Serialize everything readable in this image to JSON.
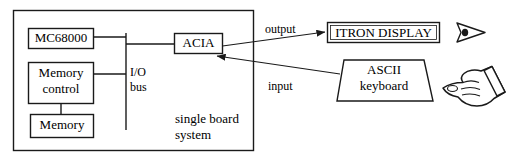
{
  "diagram": {
    "stroke_color": "#1a1a1a",
    "fill_color": "#ffffff",
    "text_color": "#000000",
    "enclosure": {
      "name": "single board system",
      "label_line1": "single board",
      "label_line2": "system"
    },
    "nodes": [
      {
        "id": "mc68000",
        "label": "MC68000",
        "shape": "rect"
      },
      {
        "id": "memory-control",
        "label_line1": "Memory",
        "label_line2": "control",
        "shape": "rect"
      },
      {
        "id": "memory",
        "label": "Memory",
        "shape": "rect"
      },
      {
        "id": "acia",
        "label": "ACIA",
        "shape": "rect"
      },
      {
        "id": "itron-display",
        "label": "ITRON DISPLAY",
        "shape": "rect"
      },
      {
        "id": "ascii-keyboard",
        "label_line1": "ASCII",
        "label_line2": "keyboard",
        "shape": "trapezoid"
      }
    ],
    "bus": {
      "id": "io-bus",
      "label_line1": "I/O",
      "label_line2": "bus"
    },
    "edges": [
      {
        "id": "output-edge",
        "label": "output",
        "from": "acia",
        "to": "itron-display",
        "arrow": "to"
      },
      {
        "id": "input-edge",
        "label": "input",
        "from": "ascii-keyboard",
        "to": "acia",
        "arrow": "to"
      }
    ],
    "icons": [
      {
        "id": "eye-icon",
        "name": "eye-icon",
        "description": "eye viewing the display"
      },
      {
        "id": "hand-icon",
        "name": "pointing-hand-icon",
        "description": "hand pointing at the keyboard"
      }
    ]
  }
}
